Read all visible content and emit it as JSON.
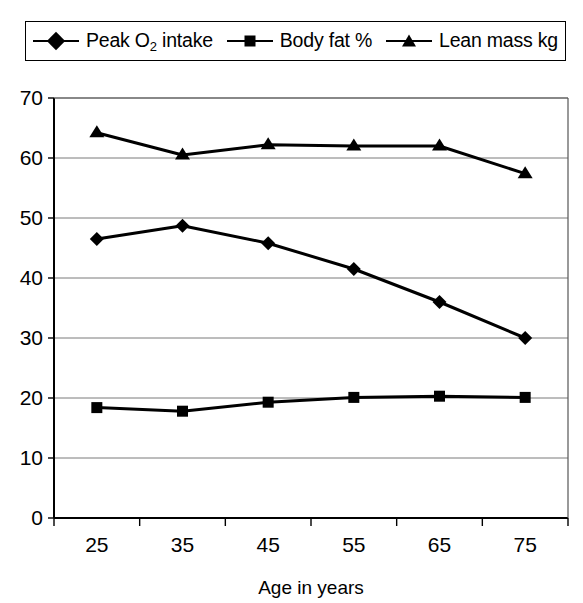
{
  "chart_data": {
    "type": "line",
    "title": "",
    "xlabel": "Age in years",
    "ylabel": "",
    "categories": [
      "25",
      "35",
      "45",
      "55",
      "65",
      "75"
    ],
    "x": [
      25,
      35,
      45,
      55,
      65,
      75
    ],
    "ylim": [
      0,
      70
    ],
    "yticks": [
      0,
      10,
      20,
      30,
      40,
      50,
      60,
      70
    ],
    "grid": true,
    "legend_position": "top",
    "series": [
      {
        "name": "Peak O2 intake",
        "label_html": "Peak O<sub>2</sub> intake",
        "marker": "diamond",
        "color": "#000000",
        "values": [
          46.5,
          48.7,
          45.8,
          41.5,
          36.0,
          30.0
        ]
      },
      {
        "name": "Body fat %",
        "label_html": "Body fat %",
        "marker": "square",
        "color": "#000000",
        "values": [
          18.4,
          17.8,
          19.3,
          20.1,
          20.3,
          20.1
        ]
      },
      {
        "name": "Lean mass kg",
        "label_html": "Lean mass kg",
        "marker": "triangle",
        "color": "#000000",
        "values": [
          64.2,
          60.5,
          62.2,
          62.0,
          62.0,
          57.4
        ]
      }
    ]
  },
  "legend": {
    "items": [
      {
        "label": "Peak O2 intake",
        "marker": "diamond"
      },
      {
        "label": "Body fat %",
        "marker": "square"
      },
      {
        "label": "Lean mass kg",
        "marker": "triangle"
      }
    ]
  },
  "axes": {
    "x_title": "Age in years",
    "x_tick_labels": [
      "25",
      "35",
      "45",
      "55",
      "65",
      "75"
    ],
    "y_tick_labels": [
      "70",
      "60",
      "50",
      "40",
      "30",
      "20",
      "10",
      "0"
    ]
  }
}
